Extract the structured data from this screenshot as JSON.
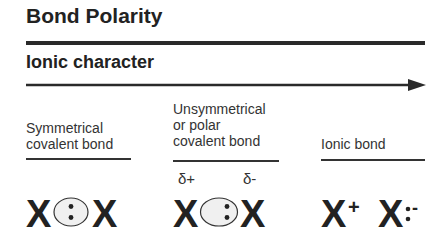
{
  "title": "Bond Polarity",
  "axis": {
    "label": "Ionic character",
    "direction": "increasing-right"
  },
  "columns": [
    {
      "label_lines": [
        "Symmetrical",
        "covalent bond"
      ],
      "left_atom": "X",
      "right_atom": "X",
      "bond_depiction": "shared electron pair centered",
      "left_charge": "",
      "right_charge": ""
    },
    {
      "label_lines": [
        "Unsymmetrical",
        "or polar",
        "covalent bond"
      ],
      "left_atom": "X",
      "right_atom": "X",
      "bond_depiction": "shared electron pair shifted right",
      "left_charge": "δ+",
      "right_charge": "δ-"
    },
    {
      "label_lines": [
        "Ionic bond"
      ],
      "left_atom": "X",
      "right_atom": "X",
      "bond_depiction": "electron pair transferred",
      "left_charge": "+",
      "right_charge": "-"
    }
  ],
  "colors": {
    "ink": "#222222",
    "orbital_fill": "#f0f0f0",
    "background": "#ffffff"
  }
}
